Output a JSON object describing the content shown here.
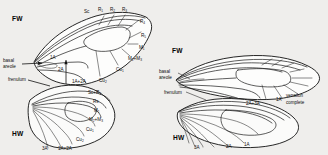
{
  "figure": {
    "background_color": "#efeeec",
    "ink_color": "#101010",
    "width": 328,
    "height": 155
  },
  "panels": [
    {
      "id": "left-panel",
      "name": "reduced-venation-panel",
      "wings": [
        {
          "id": "fw-left",
          "label": "FW",
          "label_x": 12,
          "label_y": 18
        },
        {
          "id": "hw-left",
          "label": "HW",
          "label_x": 12,
          "label_y": 133
        }
      ],
      "annotations": [
        {
          "name": "basal-areole",
          "text_lines": [
            "basal",
            "areole"
          ],
          "x": 4,
          "y": 62
        },
        {
          "name": "frenulum",
          "text": "frenulum",
          "x": 10,
          "y": 79
        }
      ],
      "vein_labels": [
        {
          "name": "vein-sc-fw",
          "base": "Sc",
          "sub": "",
          "x": 86,
          "y": 11
        },
        {
          "name": "vein-r1-fw",
          "base": "R",
          "sub": "1",
          "x": 100,
          "y": 9
        },
        {
          "name": "vein-r2-fw",
          "base": "R",
          "sub": "2",
          "x": 112,
          "y": 9
        },
        {
          "name": "vein-r3-fw",
          "base": "R",
          "sub": "3",
          "x": 124,
          "y": 9
        },
        {
          "name": "vein-r4-fw",
          "base": "R",
          "sub": "4",
          "x": 140,
          "y": 21
        },
        {
          "name": "vein-r5-fw",
          "base": "R",
          "sub": "5",
          "x": 141,
          "y": 35
        },
        {
          "name": "vein-m1-fw",
          "base": "M",
          "sub": "1",
          "x": 139,
          "y": 47
        },
        {
          "name": "vein-m2m3-fw",
          "base": "M",
          "sub": "2",
          "suffix": "+M",
          "sub2": "3",
          "x": 131,
          "y": 58
        },
        {
          "name": "vein-cu1-fw",
          "base": "Cu",
          "sub": "1",
          "x": 118,
          "y": 69
        },
        {
          "name": "vein-cu2-fw",
          "base": "Cu",
          "sub": "2",
          "x": 102,
          "y": 80
        },
        {
          "name": "vein-1a-fw",
          "base": "1A",
          "sub": "",
          "x": 52,
          "y": 58
        },
        {
          "name": "vein-2a-fw",
          "base": "2A",
          "sub": "",
          "x": 60,
          "y": 70
        },
        {
          "name": "vein-1a2a-fw",
          "base": "1A+2A",
          "sub": "",
          "x": 76,
          "y": 82
        },
        {
          "name": "vein-scr1-hw",
          "base": "Sc+R",
          "sub": "1",
          "x": 90,
          "y": 92
        },
        {
          "name": "vein-rs-hw",
          "base": "Rs",
          "sub": "",
          "x": 95,
          "y": 101
        },
        {
          "name": "vein-m1-hw",
          "base": "M",
          "sub": "1",
          "x": 96,
          "y": 110
        },
        {
          "name": "vein-m2m3-hw",
          "base": "M",
          "sub": "2",
          "suffix": "+M",
          "sub2": "3",
          "x": 92,
          "y": 119
        },
        {
          "name": "vein-cu1-hw",
          "base": "Cu",
          "sub": "1",
          "x": 88,
          "y": 129
        },
        {
          "name": "vein-cu2-hw",
          "base": "Cu",
          "sub": "2",
          "x": 78,
          "y": 139
        },
        {
          "name": "vein-3a-hw",
          "base": "3A",
          "sub": "",
          "x": 45,
          "y": 148
        },
        {
          "name": "vein-1a2a-hw",
          "base": "1A+2A",
          "sub": "",
          "x": 60,
          "y": 148
        }
      ]
    },
    {
      "id": "right-panel",
      "name": "complete-venation-panel",
      "wings": [
        {
          "id": "fw-right",
          "label": "FW",
          "label_x": 172,
          "label_y": 50
        },
        {
          "id": "hw-right",
          "label": "HW",
          "label_x": 173,
          "label_y": 137
        }
      ],
      "annotations": [
        {
          "name": "basal-areole",
          "text_lines": [
            "basal",
            "areole"
          ],
          "x": 161,
          "y": 75
        },
        {
          "name": "frenulum",
          "text": "frenulum",
          "x": 166,
          "y": 93
        },
        {
          "name": "venation-complete",
          "text_lines": [
            "venation",
            "complete"
          ],
          "x": 288,
          "y": 98
        }
      ],
      "vein_labels": [
        {
          "name": "vein-2a3a-fw-right",
          "base": "2A+3A",
          "sub": "",
          "x": 250,
          "y": 103
        },
        {
          "name": "vein-1a-fw-right",
          "base": "1A",
          "sub": "",
          "x": 280,
          "y": 99
        },
        {
          "name": "vein-3a-hw-right",
          "base": "3A",
          "sub": "",
          "x": 196,
          "y": 147
        },
        {
          "name": "vein-2a-hw-right",
          "base": "2A",
          "sub": "",
          "x": 229,
          "y": 146
        },
        {
          "name": "vein-1a-hw-right",
          "base": "1A",
          "sub": "",
          "x": 246,
          "y": 144
        }
      ]
    }
  ],
  "caption": ""
}
